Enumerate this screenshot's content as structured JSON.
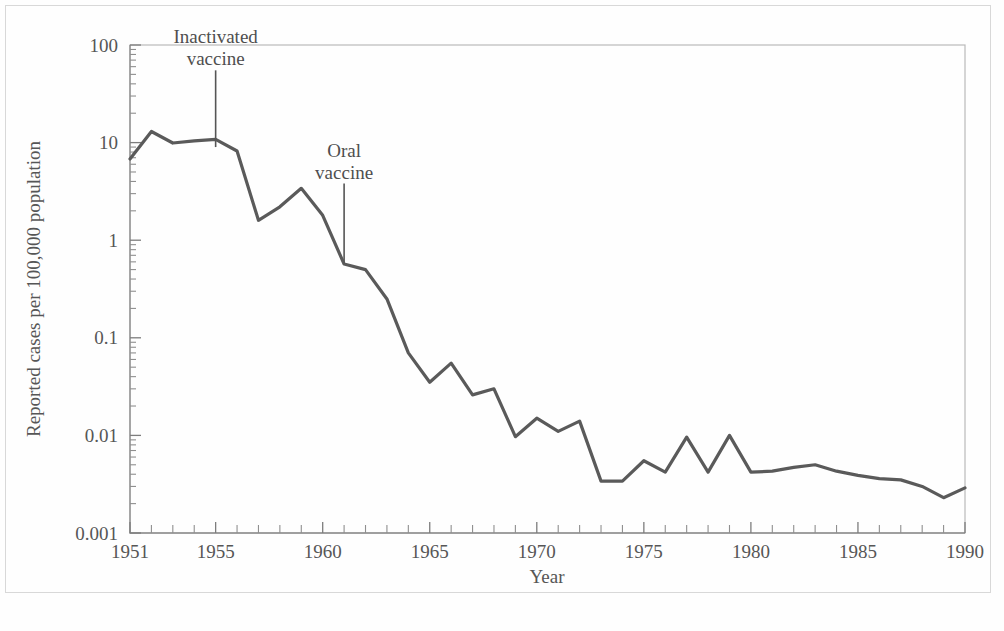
{
  "figure": {
    "background_color": "#fefefe",
    "line_color": "#5a5a5a",
    "axis_color": "#8d8d8d",
    "frame_color": "#b9b9b9",
    "text_color": "#565656"
  },
  "chart_data": {
    "type": "line",
    "title": "",
    "xlabel": "Year",
    "ylabel": "Reported cases per 100,000 population",
    "yscale": "log",
    "ylim": [
      0.001,
      100
    ],
    "xlim": [
      1951,
      1990
    ],
    "grid": false,
    "legend": "none",
    "y_tick_labels": [
      "100",
      "10",
      "1",
      "0.1",
      "0.01",
      "0.001"
    ],
    "y_tick_values": [
      100,
      10,
      1,
      0.1,
      0.01,
      0.001
    ],
    "x_tick_labels": [
      "1951",
      "1955",
      "1960",
      "1965",
      "1970",
      "1975",
      "1980",
      "1985",
      "1990"
    ],
    "x_tick_values": [
      1951,
      1955,
      1960,
      1965,
      1970,
      1975,
      1980,
      1985,
      1990
    ],
    "x": [
      1951,
      1952,
      1953,
      1954,
      1955,
      1956,
      1957,
      1958,
      1959,
      1960,
      1961,
      1962,
      1963,
      1964,
      1965,
      1966,
      1967,
      1968,
      1969,
      1970,
      1971,
      1972,
      1973,
      1974,
      1975,
      1976,
      1977,
      1978,
      1979,
      1980,
      1981,
      1982,
      1983,
      1984,
      1985,
      1986,
      1987,
      1988,
      1989,
      1990
    ],
    "values": [
      6.8,
      13.0,
      9.9,
      10.4,
      10.8,
      8.2,
      1.6,
      2.2,
      3.4,
      1.8,
      0.57,
      0.5,
      0.25,
      0.07,
      0.035,
      0.055,
      0.026,
      0.03,
      0.0097,
      0.015,
      0.011,
      0.014,
      0.0034,
      0.0034,
      0.0055,
      0.0042,
      0.0096,
      0.0042,
      0.01,
      0.0042,
      0.0043,
      0.0047,
      0.005,
      0.0043,
      0.0039,
      0.0036,
      0.0035,
      0.003,
      0.0023,
      0.0029
    ],
    "series": [
      {
        "name": "Reported poliomyelitis cases",
        "values": [
          6.8,
          13.0,
          9.9,
          10.4,
          10.8,
          8.2,
          1.6,
          2.2,
          3.4,
          1.8,
          0.57,
          0.5,
          0.25,
          0.07,
          0.035,
          0.055,
          0.026,
          0.03,
          0.0097,
          0.015,
          0.011,
          0.014,
          0.0034,
          0.0034,
          0.0055,
          0.0042,
          0.0096,
          0.0042,
          0.01,
          0.0042,
          0.0043,
          0.0047,
          0.005,
          0.0043,
          0.0039,
          0.0036,
          0.0035,
          0.003,
          0.0023,
          0.0029
        ]
      }
    ],
    "annotations": [
      {
        "id": "inactivated-vaccine",
        "line1": "Inactivated",
        "line2": "vaccine",
        "x_year": 1955,
        "pointer_top_value": 55,
        "pointer_bottom_value": 9.0
      },
      {
        "id": "oral-vaccine",
        "line1": "Oral",
        "line2": "vaccine",
        "x_year": 1961,
        "pointer_top_value": 3.8,
        "pointer_bottom_value": 0.58
      }
    ]
  }
}
